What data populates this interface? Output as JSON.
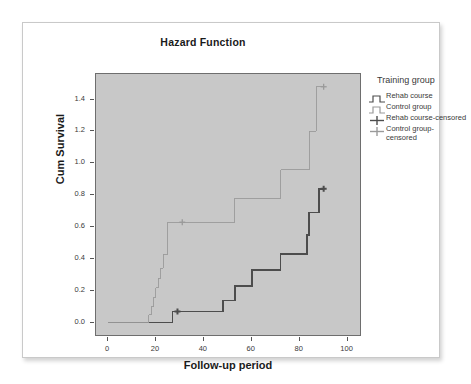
{
  "chart_data": {
    "type": "line",
    "title": "Hazard Function",
    "xlabel": "Follow-up period",
    "ylabel": "Cum Survival",
    "xlim": [
      -5,
      106
    ],
    "ylim": [
      -0.09,
      1.56
    ],
    "xticks": [
      0,
      20,
      40,
      60,
      80,
      100
    ],
    "xtick_labels": [
      "0",
      "20",
      "40",
      "60",
      "80",
      "100"
    ],
    "yticks": [
      0.0,
      0.2,
      0.4,
      0.6,
      0.8,
      1.0,
      1.2,
      1.4
    ],
    "ytick_labels": [
      "0.0",
      "0.2",
      "0.4",
      "0.6",
      "0.8",
      "1.0",
      "1.2",
      "1.4"
    ],
    "grid": false,
    "legend_position": "right",
    "legend_title": "Training group",
    "step_style": "post",
    "series": [
      {
        "name": "Rehab course",
        "color": "#4d4d4d",
        "line_width": 1.6,
        "points": [
          [
            0,
            0.0
          ],
          [
            27,
            0.0
          ],
          [
            27,
            0.07
          ],
          [
            48,
            0.07
          ],
          [
            48,
            0.14
          ],
          [
            53,
            0.14
          ],
          [
            53,
            0.23
          ],
          [
            60,
            0.23
          ],
          [
            60,
            0.33
          ],
          [
            72,
            0.33
          ],
          [
            72,
            0.43
          ],
          [
            83,
            0.43
          ],
          [
            83,
            0.55
          ],
          [
            84,
            0.55
          ],
          [
            84,
            0.69
          ],
          [
            88,
            0.69
          ],
          [
            88,
            0.84
          ],
          [
            90,
            0.84
          ]
        ],
        "censored_marks": [
          [
            29,
            0.07
          ],
          [
            90,
            0.84
          ]
        ]
      },
      {
        "name": "Control group",
        "color": "#9a9a9a",
        "line_width": 0.9,
        "points": [
          [
            0,
            0.0
          ],
          [
            17,
            0.0
          ],
          [
            17,
            0.05
          ],
          [
            18,
            0.05
          ],
          [
            18,
            0.1
          ],
          [
            19,
            0.1
          ],
          [
            19,
            0.16
          ],
          [
            20,
            0.16
          ],
          [
            20,
            0.22
          ],
          [
            21,
            0.22
          ],
          [
            21,
            0.28
          ],
          [
            22,
            0.28
          ],
          [
            22,
            0.34
          ],
          [
            23,
            0.34
          ],
          [
            23,
            0.43
          ],
          [
            25,
            0.43
          ],
          [
            25,
            0.63
          ],
          [
            53,
            0.63
          ],
          [
            53,
            0.78
          ],
          [
            72,
            0.78
          ],
          [
            72,
            0.96
          ],
          [
            84,
            0.96
          ],
          [
            84,
            1.2
          ],
          [
            87,
            1.2
          ],
          [
            87,
            1.48
          ],
          [
            90,
            1.48
          ]
        ],
        "censored_marks": [
          [
            31,
            0.63
          ],
          [
            90,
            1.48
          ]
        ]
      }
    ],
    "legend_entries": [
      {
        "label": "Rehab course",
        "marker": "step",
        "color": "#4d4d4d"
      },
      {
        "label": "Control group",
        "marker": "step",
        "color": "#9a9a9a"
      },
      {
        "label": "Rehab course-censored",
        "marker": "plus",
        "color": "#4d4d4d"
      },
      {
        "label": "Control group-\ncensored",
        "marker": "plus",
        "color": "#9a9a9a"
      }
    ],
    "panel_color": "#c8c8c8",
    "frame_color": "#6e6e6e"
  }
}
